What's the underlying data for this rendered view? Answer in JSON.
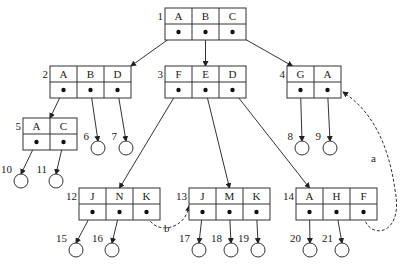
{
  "diagram": {
    "type": "B-tree with leaf pointers",
    "nodes": [
      {
        "id": "1",
        "keys": [
          "A",
          "B",
          "C"
        ],
        "x": 165,
        "y": 8,
        "w": 27
      },
      {
        "id": "2",
        "keys": [
          "A",
          "B",
          "D"
        ],
        "x": 50,
        "y": 66,
        "w": 27
      },
      {
        "id": "3",
        "keys": [
          "F",
          "E",
          "D"
        ],
        "x": 165,
        "y": 66,
        "w": 27
      },
      {
        "id": "4",
        "keys": [
          "G",
          "A"
        ],
        "x": 287,
        "y": 66,
        "w": 27
      },
      {
        "id": "5",
        "keys": [
          "A",
          "C"
        ],
        "x": 23,
        "y": 118,
        "w": 27
      },
      {
        "id": "12",
        "keys": [
          "J",
          "N",
          "K"
        ],
        "x": 79,
        "y": 188,
        "w": 27
      },
      {
        "id": "13",
        "keys": [
          "J",
          "M",
          "K"
        ],
        "x": 189,
        "y": 188,
        "w": 27
      },
      {
        "id": "14",
        "keys": [
          "A",
          "H",
          "F"
        ],
        "x": 296,
        "y": 188,
        "w": 27
      }
    ],
    "leaves": [
      {
        "id": "6",
        "cx": 98,
        "cy": 148
      },
      {
        "id": "7",
        "cx": 126,
        "cy": 148
      },
      {
        "id": "8",
        "cx": 302,
        "cy": 148
      },
      {
        "id": "9",
        "cx": 330,
        "cy": 148
      },
      {
        "id": "10",
        "cx": 21,
        "cy": 181
      },
      {
        "id": "11",
        "cx": 56,
        "cy": 181
      },
      {
        "id": "15",
        "cx": 76,
        "cy": 250
      },
      {
        "id": "16",
        "cx": 112,
        "cy": 250
      },
      {
        "id": "17",
        "cx": 199,
        "cy": 250
      },
      {
        "id": "18",
        "cx": 231,
        "cy": 250
      },
      {
        "id": "19",
        "cx": 258,
        "cy": 250
      },
      {
        "id": "20",
        "cx": 310,
        "cy": 250
      },
      {
        "id": "21",
        "cx": 342,
        "cy": 250
      }
    ],
    "edges": [
      {
        "from": "1.0",
        "to": "2"
      },
      {
        "from": "1.1",
        "to": "3"
      },
      {
        "from": "1.2",
        "to": "4"
      },
      {
        "from": "2.0",
        "to": "5"
      },
      {
        "from": "2.1",
        "to": "6"
      },
      {
        "from": "2.2",
        "to": "7"
      },
      {
        "from": "3.0",
        "to": "12"
      },
      {
        "from": "3.1",
        "to": "13"
      },
      {
        "from": "3.2",
        "to": "14"
      },
      {
        "from": "4.0",
        "to": "8"
      },
      {
        "from": "4.1",
        "to": "9"
      },
      {
        "from": "5.0",
        "to": "10"
      },
      {
        "from": "5.1",
        "to": "11"
      },
      {
        "from": "12.0",
        "to": "15"
      },
      {
        "from": "12.1",
        "to": "16"
      },
      {
        "from": "13.0",
        "to": "17"
      },
      {
        "from": "13.1",
        "to": "18"
      },
      {
        "from": "13.2",
        "to": "19"
      },
      {
        "from": "14.0",
        "to": "20"
      },
      {
        "from": "14.1",
        "to": "21"
      }
    ],
    "dashed_links": [
      {
        "label": "a",
        "from": "14.2",
        "to": "4"
      },
      {
        "label": "b",
        "from": "12.2",
        "to": "13"
      }
    ]
  }
}
